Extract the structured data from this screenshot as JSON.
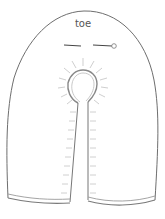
{
  "diagram": {
    "type": "pattern-piece",
    "label": "toe",
    "colors": {
      "outline": "#6e6e6e",
      "hem": "#8a8a8a",
      "stitches": "#c8c8c8",
      "text": "#555555",
      "background": "#ffffff"
    },
    "elements": {
      "outline": "arched pattern outline",
      "grainline": "grainline arrow with circle end",
      "opening": "keyhole opening with radiating stitch marks",
      "slit": "center slit with stitch marks along both edges",
      "hem": "double hem lines at bottom of each panel"
    }
  }
}
